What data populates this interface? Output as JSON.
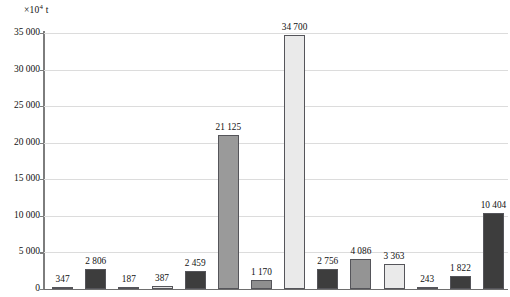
{
  "chart_data": {
    "type": "bar",
    "title": "",
    "subtitle": "",
    "xlabel": "",
    "ylabel": "×10⁴ t",
    "unit_label": "×10",
    "unit_exponent": "4",
    "unit_suffix": " t",
    "ylim": [
      0,
      35000
    ],
    "grid": true,
    "legend": null,
    "x_tick_labels": [],
    "y_tick_labels": [
      "0",
      "5 000",
      "10 000",
      "15 000",
      "20 000",
      "25 000",
      "30 000",
      "35 000"
    ],
    "y_tick_values": [
      0,
      5000,
      10000,
      15000,
      20000,
      25000,
      30000,
      35000
    ],
    "categories": [
      "1",
      "2",
      "3",
      "4",
      "5",
      "6",
      "7",
      "8",
      "9",
      "10",
      "11",
      "12",
      "13",
      "14"
    ],
    "values": [
      347,
      2806,
      187,
      387,
      2459,
      21125,
      1170,
      34700,
      2756,
      4086,
      3363,
      243,
      1822,
      10404
    ],
    "value_labels": [
      "347",
      "2 806",
      "187",
      "387",
      "2 459",
      "21 125",
      "1 170",
      "34 700",
      "2 756",
      "4 086",
      "3 363",
      "243",
      "1 822",
      "10 404"
    ],
    "bar_shades": [
      "#d8d8d8",
      "#3d3d3d",
      "#d8d8d8",
      "#e2e2e2",
      "#3d3d3d",
      "#9a9a9a",
      "#8f8f8f",
      "#eaeaea",
      "#3d3d3d",
      "#949494",
      "#eaeaea",
      "#d8d8d8",
      "#3d3d3d",
      "#3d3d3d"
    ],
    "colors": {
      "dark": "#3d3d3d",
      "medium": "#9a9a9a",
      "light": "#d8d8d8",
      "very_light": "#eaeaea",
      "gridline": "#dcdcdc",
      "axis": "#7d7d7d",
      "text": "#111111",
      "background": "#ffffff",
      "bar_border": "#55555a"
    }
  }
}
